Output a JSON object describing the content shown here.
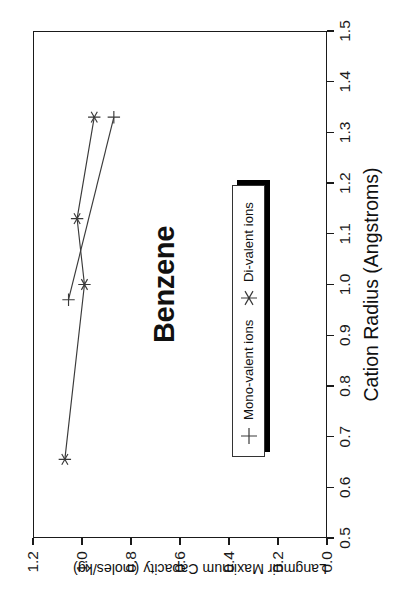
{
  "chart_data": {
    "type": "line",
    "title": "Benzene",
    "xlabel": "Cation Radius (Angstroms)",
    "ylabel": "Langmuir Maximum Capacity (moles/kg)",
    "xlim": [
      0.5,
      1.5
    ],
    "ylim": [
      0.0,
      1.2
    ],
    "xticks": [
      "0.5",
      "0.6",
      "0.7",
      "0.8",
      "0.9",
      "1.0",
      "1.1",
      "1.2",
      "1.3",
      "1.4",
      "1.5"
    ],
    "xtick_values": [
      0.5,
      0.6,
      0.7,
      0.8,
      0.9,
      1.0,
      1.1,
      1.2,
      1.3,
      1.4,
      1.5
    ],
    "yticks": [
      "0.0",
      "0.2",
      "0.4",
      "0.6",
      "0.8",
      "1.0",
      "1.2"
    ],
    "ytick_values": [
      0.0,
      0.2,
      0.4,
      0.6,
      0.8,
      1.0,
      1.2
    ],
    "grid": false,
    "legend_position": "lower center",
    "rotation_deg": -90,
    "series": [
      {
        "name": "Mono-valent ions",
        "marker": "plus",
        "color": "#3a3a3a",
        "x": [
          0.97,
          1.33
        ],
        "y": [
          1.055,
          0.87
        ]
      },
      {
        "name": "Di-valent ions",
        "marker": "asterisk",
        "color": "#3a3a3a",
        "x": [
          0.655,
          1.0,
          1.13,
          1.33
        ],
        "y": [
          1.07,
          0.99,
          1.02,
          0.95
        ]
      }
    ]
  },
  "legend": {
    "items": [
      {
        "label": "Mono-valent ions",
        "marker": "plus"
      },
      {
        "label": "Di-valent ions",
        "marker": "asterisk"
      }
    ]
  }
}
